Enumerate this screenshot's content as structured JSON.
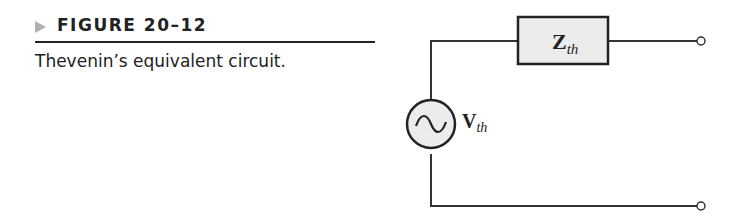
{
  "figure": {
    "label": "FIGURE 20–12",
    "caption": "Thevenin’s equivalent circuit."
  },
  "circuit": {
    "impedance": {
      "symbol": "Z",
      "subscript": "th"
    },
    "source": {
      "symbol": "V",
      "subscript": "th",
      "type": "ac-voltage-source"
    },
    "terminals": 2,
    "colors": {
      "wire": "#333333",
      "fill": "#ececec"
    }
  }
}
